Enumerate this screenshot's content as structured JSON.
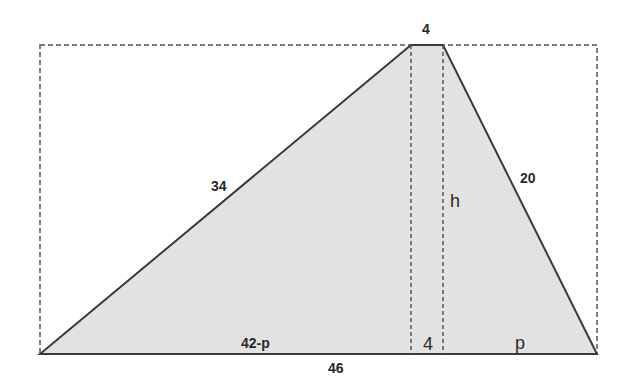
{
  "figure": {
    "type": "trapezoid-height-problem",
    "bounding_box": {
      "style": "dashed",
      "x1": 40,
      "y1": 45,
      "x2": 597,
      "y2": 354
    },
    "shape": {
      "fill": "#e2e2e2",
      "stroke": "#3a3a3a",
      "vertices": [
        [
          40,
          354
        ],
        [
          411,
          45
        ],
        [
          443,
          45
        ],
        [
          597,
          354
        ]
      ]
    },
    "height_lines": [
      {
        "x": 411,
        "y1": 45,
        "y2": 354
      },
      {
        "x": 443,
        "y1": 45,
        "y2": 354
      }
    ]
  },
  "labels": {
    "top_base": "4",
    "left_side": "34",
    "right_side": "20",
    "height": "h",
    "bottom_left_segment": "42-p",
    "bottom_middle_segment": "4",
    "bottom_right_segment": "p",
    "bottom_base": "46"
  },
  "colors": {
    "fill": "#e2e2e2",
    "stroke": "#3a3a3a",
    "dash": "#555555",
    "text": "#2a2a2a"
  }
}
